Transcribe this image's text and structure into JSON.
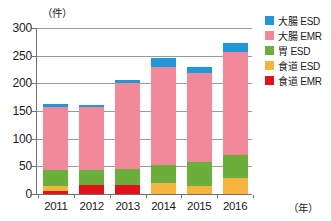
{
  "chart_data": {
    "type": "bar",
    "stacked": true,
    "title": "",
    "xlabel": "年",
    "ylabel": "件",
    "x_unit_label": "（年）",
    "y_unit_label": "（件）",
    "categories": [
      "2011",
      "2012",
      "2013",
      "2014",
      "2015",
      "2016"
    ],
    "ylim": [
      0,
      300
    ],
    "yticks": [
      0,
      50,
      100,
      150,
      200,
      250,
      300
    ],
    "ytick_labels": [
      "0",
      "50",
      "100",
      "150",
      "200",
      "250",
      "300"
    ],
    "grid": true,
    "grid_axis": "y",
    "legend_position": "right-top",
    "series": [
      {
        "name": "食道 EMR",
        "color": "#e2121a",
        "values": [
          5,
          16,
          16,
          0,
          0,
          0
        ]
      },
      {
        "name": "食道 ESD",
        "color": "#f6b43e",
        "values": [
          9,
          0,
          0,
          20,
          15,
          29
        ]
      },
      {
        "name": "胃 ESD",
        "color": "#6bae3c",
        "values": [
          29,
          27,
          30,
          33,
          42,
          42
        ]
      },
      {
        "name": "大腸 EMR",
        "color": "#f2899a",
        "values": [
          114,
          114,
          154,
          177,
          161,
          185
        ]
      },
      {
        "name": "大腸 ESD",
        "color": "#2196d8",
        "values": [
          5,
          3,
          7,
          15,
          12,
          17
        ]
      }
    ],
    "totals": [
      162,
      160,
      207,
      245,
      230,
      273
    ]
  },
  "legend": {
    "items": [
      {
        "label": "大腸 ESD",
        "color": "#2196d8"
      },
      {
        "label": "大腸 EMR",
        "color": "#f2899a"
      },
      {
        "label": "胃 ESD",
        "color": "#6bae3c"
      },
      {
        "label": "食道 ESD",
        "color": "#f6b43e"
      },
      {
        "label": "食道 EMR",
        "color": "#e2121a"
      }
    ]
  },
  "axes": {
    "y_unit": "（件）",
    "x_unit": "（年）"
  }
}
